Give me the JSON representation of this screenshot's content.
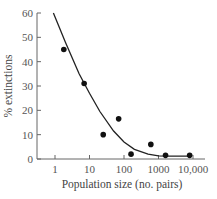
{
  "chart_data": {
    "type": "scatter",
    "title": "",
    "xlabel": "Population size (no. pairs)",
    "ylabel": "% extinctions",
    "xscale": "log",
    "xlim": [
      0.5,
      10000
    ],
    "ylim": [
      0,
      60
    ],
    "x_ticks": [
      "1",
      "10",
      "100",
      "1000",
      "10,000"
    ],
    "x_tick_values": [
      1,
      10,
      100,
      1000,
      10000
    ],
    "y_ticks": [
      "0",
      "10",
      "20",
      "30",
      "40",
      "50",
      "60"
    ],
    "y_tick_values": [
      0,
      10,
      20,
      30,
      40,
      50,
      60
    ],
    "grid": false,
    "legend": null,
    "series": [
      {
        "name": "Observed",
        "kind": "points",
        "x": [
          1.8,
          7,
          25,
          70,
          160,
          600,
          1600,
          8000
        ],
        "y": [
          45,
          31,
          10,
          16.5,
          2,
          6,
          1.5,
          1.5
        ]
      },
      {
        "name": "Fitted curve",
        "kind": "line",
        "x": [
          0.9,
          2,
          5,
          10,
          20,
          50,
          100,
          200,
          500,
          1000,
          2000,
          5000,
          8000
        ],
        "y": [
          60,
          48,
          35,
          27,
          19.5,
          11.5,
          7,
          4,
          2,
          1.3,
          1.2,
          1.2,
          1.2
        ]
      }
    ]
  },
  "colors": {
    "axis": "#666666",
    "points": "#111111",
    "curve": "#222222"
  }
}
